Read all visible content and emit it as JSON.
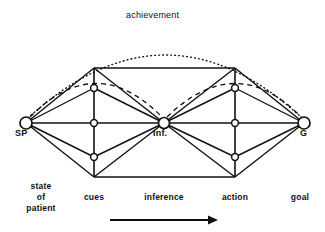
{
  "figure": {
    "title": "",
    "type": "lens-model-diagram",
    "background_color": "#ffffff",
    "line_color": "#111111"
  },
  "arcs": {
    "achievement": {
      "label": "achievement",
      "style": "dotted",
      "label_x": 163,
      "label_y": 18
    },
    "left_dashed": {
      "label": "",
      "style": "dashed"
    },
    "right_dashed": {
      "label": "",
      "style": "dashed"
    }
  },
  "nodes": [
    {
      "id": "SP",
      "label": "SP",
      "x": 26,
      "y": 123,
      "r": 6,
      "label_x": 16,
      "label_y": 131
    },
    {
      "id": "INF",
      "label": "Inf.",
      "x": 164,
      "y": 123,
      "r": 5.5,
      "label_x": 153,
      "label_y": 131
    },
    {
      "id": "G",
      "label": "G",
      "x": 304,
      "y": 123,
      "r": 6,
      "label_x": 300,
      "label_y": 131
    }
  ],
  "columns": {
    "cues": {
      "x": 94,
      "nodes_y": [
        68,
        88,
        123,
        157,
        177
      ]
    },
    "action": {
      "x": 235,
      "nodes_y": [
        68,
        88,
        123,
        157,
        177
      ]
    }
  },
  "axis_labels": [
    {
      "id": "state-of-patient",
      "lines": [
        "state",
        "of",
        "patient"
      ],
      "x": 40,
      "y": 184
    },
    {
      "id": "cues",
      "lines": [
        "cues"
      ],
      "x": 94,
      "y": 196
    },
    {
      "id": "inference",
      "lines": [
        "inference"
      ],
      "x": 164,
      "y": 196
    },
    {
      "id": "action",
      "lines": [
        "action"
      ],
      "x": 235,
      "y": 196
    },
    {
      "id": "goal",
      "lines": [
        "goal"
      ],
      "x": 303,
      "y": 196
    }
  ],
  "arrow": {
    "id": "process-direction-arrow",
    "x1": 110,
    "x2": 212,
    "y": 220
  }
}
